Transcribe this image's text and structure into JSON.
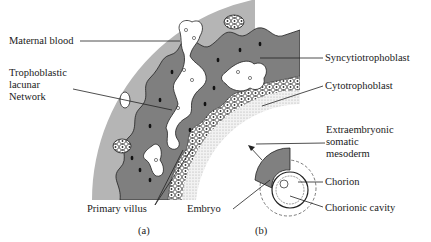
{
  "figure": {
    "panels": [
      {
        "id": "a",
        "caption": "(a)"
      },
      {
        "id": "b",
        "caption": "(b)"
      }
    ],
    "labels": {
      "maternal_blood": "Maternal blood",
      "trophoblastic_1": "Trophoblastic",
      "trophoblastic_2": "lacunar",
      "trophoblastic_3": "Network",
      "syncytiotrophoblast": "Syncytiotrophoblast",
      "cytotrophoblast": "Cytotrophoblast",
      "extraembryonic_1": "Extraembryonic",
      "extraembryonic_2": "somatic",
      "extraembryonic_3": "mesoderm",
      "chorion": "Chorion",
      "chorionic_cavity": "Chorionic cavity",
      "primary_villus": "Primary villus",
      "embryo": "Embryo"
    },
    "colors": {
      "maternal_tissue": "#b4b4b4",
      "syncytio": "#7d7d7d",
      "lacunae": "#ffffff",
      "nuclei": "#111111",
      "mesoderm": "#e6e6e6"
    }
  }
}
